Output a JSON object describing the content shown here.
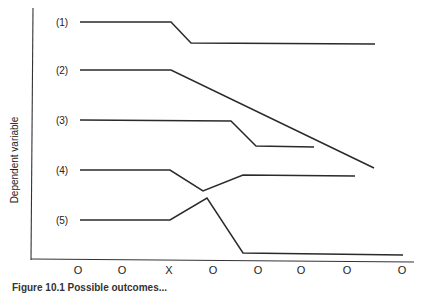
{
  "chart_data": {
    "type": "line",
    "title": "",
    "xlabel": "",
    "ylabel": "Dependent variable",
    "x_tick_labels": [
      "O",
      "O",
      "X",
      "O",
      "O",
      "O",
      "O",
      "O"
    ],
    "grid": false,
    "legend": "none (series labelled inline at left)",
    "series": [
      {
        "name": "(1)",
        "description": "flat, then step down after X, stays lower",
        "points": [
          [
            80,
            22
          ],
          [
            171,
            22
          ],
          [
            191,
            43
          ],
          [
            375,
            44
          ]
        ]
      },
      {
        "name": "(2)",
        "description": "flat, then continuous downward trend after X",
        "points": [
          [
            80,
            70
          ],
          [
            171,
            70
          ],
          [
            374,
            168
          ]
        ]
      },
      {
        "name": "(3)",
        "description": "flat, delayed step down later",
        "points": [
          [
            80,
            120
          ],
          [
            231,
            121
          ],
          [
            256,
            146
          ],
          [
            314,
            147
          ]
        ]
      },
      {
        "name": "(4)",
        "description": "flat, temporary dip after X, then recovers to near baseline",
        "points": [
          [
            80,
            170
          ],
          [
            170,
            170
          ],
          [
            203,
            191
          ],
          [
            243,
            175
          ],
          [
            355,
            176
          ]
        ]
      },
      {
        "name": "(5)",
        "description": "flat, temporary rise after X, then sharp drop to much lower level",
        "points": [
          [
            80,
            220
          ],
          [
            170,
            220
          ],
          [
            207,
            198
          ],
          [
            243,
            253
          ],
          [
            403,
            255
          ]
        ]
      }
    ],
    "tick_positions_px": [
      78,
      122,
      169,
      213,
      258,
      301,
      347,
      402
    ]
  },
  "axes": {
    "y_label": "Dependent variable"
  },
  "caption": "Figure 10.1  Possible outcomes..."
}
